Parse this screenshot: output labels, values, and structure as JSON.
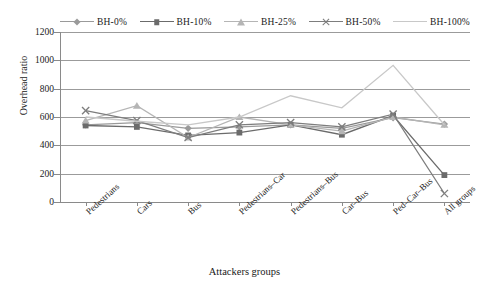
{
  "chart_data": {
    "type": "line",
    "title": "",
    "xlabel": "Attackers groups",
    "ylabel": "Overhead ratio",
    "ylim": [
      0,
      1200
    ],
    "ytick_step": 200,
    "yticks": [
      0,
      200,
      400,
      600,
      800,
      1000,
      1200
    ],
    "grid": true,
    "legend_position": "top",
    "categories": [
      "Pedestrians",
      "Cars",
      "Bus",
      "Pedestrians–Car",
      "Pedestrians–Bus",
      "Car–Bus",
      "Ped–Car–Bus",
      "All groups"
    ],
    "series": [
      {
        "name": "BH-0%",
        "marker": "diamond",
        "color": "#9a9a9a",
        "values": [
          545,
          560,
          520,
          530,
          545,
          520,
          595,
          550
        ]
      },
      {
        "name": "BH-10%",
        "marker": "square",
        "color": "#6b6b6b",
        "values": [
          540,
          530,
          470,
          490,
          545,
          475,
          610,
          190
        ]
      },
      {
        "name": "BH-25%",
        "marker": "triangle",
        "color": "#b5b5b5",
        "values": [
          575,
          680,
          455,
          600,
          545,
          500,
          600,
          545
        ]
      },
      {
        "name": "BH-50%",
        "marker": "x",
        "color": "#7d7d7d",
        "values": [
          645,
          575,
          455,
          545,
          560,
          530,
          620,
          60
        ]
      },
      {
        "name": "BH-100%",
        "marker": "none",
        "color": "#c8c8c8",
        "values": [
          600,
          570,
          545,
          600,
          750,
          665,
          965,
          545
        ]
      }
    ]
  },
  "legend": {
    "items": [
      {
        "label": "BH-0%",
        "marker": "diamond",
        "color": "#9a9a9a"
      },
      {
        "label": "BH-10%",
        "marker": "square",
        "color": "#6b6b6b"
      },
      {
        "label": "BH-25%",
        "marker": "triangle",
        "color": "#b5b5b5"
      },
      {
        "label": "BH-50%",
        "marker": "x",
        "color": "#7d7d7d"
      },
      {
        "label": "BH-100%",
        "marker": "none",
        "color": "#c8c8c8"
      }
    ]
  }
}
